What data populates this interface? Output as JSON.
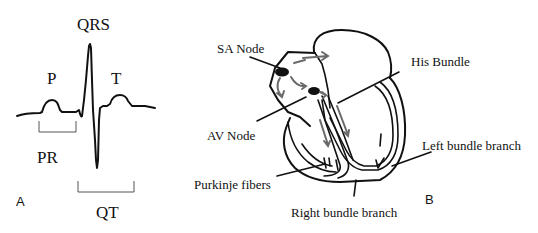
{
  "panel_a": {
    "panel_letter": "A",
    "labels": {
      "qrs": "QRS",
      "p": "P",
      "t": "T",
      "pr": "PR",
      "qt": "QT"
    }
  },
  "panel_b": {
    "panel_letter": "B",
    "labels": {
      "sa_node": "SA Node",
      "av_node": "AV Node",
      "his_bundle": "His Bundle",
      "left_bundle_branch": "Left bundle branch",
      "purkinje_fibers": "Purkinje fibers",
      "right_bundle_branch": "Right bundle branch"
    }
  },
  "colors": {
    "line": "#111111",
    "arrow": "#6a6a6a",
    "bracket": "#555555",
    "background": "#ffffff"
  }
}
